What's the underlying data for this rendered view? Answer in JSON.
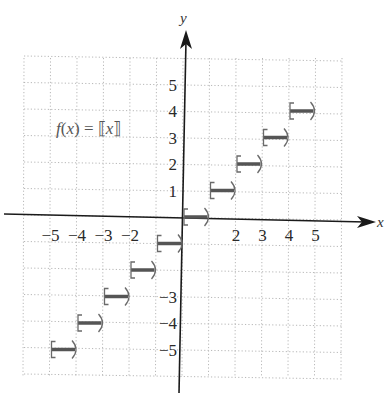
{
  "chart_data": {
    "type": "line",
    "subtype": "step",
    "title": "f(x) = ⟦x⟧",
    "function_label": {
      "prefix": "f",
      "open": "(",
      "var": "x",
      "close": ")",
      "eq": " = ",
      "bracket_open": "⟦",
      "bracket_var": "x",
      "bracket_close": "⟧"
    },
    "xlabel": "x",
    "ylabel": "y",
    "xlim": [
      -6,
      6
    ],
    "ylim": [
      -6,
      6
    ],
    "grid": true,
    "grid_style": "dotted",
    "x_ticks": [
      -5,
      -4,
      -3,
      -2,
      2,
      3,
      4,
      5
    ],
    "x_tick_labels": [
      "−5",
      "−4",
      "−3",
      "−2",
      "2",
      "3",
      "4",
      "5"
    ],
    "y_ticks": [
      5,
      4,
      3,
      2,
      1,
      -3,
      -4,
      -5
    ],
    "y_tick_labels": [
      "5",
      "4",
      "3",
      "2",
      "1",
      "−3",
      "−4",
      "−5"
    ],
    "series": [
      {
        "name": "f(x) = [[x]]",
        "segments": [
          {
            "x_start": -5,
            "x_end": -4,
            "y": -5,
            "closed_left": true,
            "open_right": true
          },
          {
            "x_start": -4,
            "x_end": -3,
            "y": -4,
            "closed_left": true,
            "open_right": true
          },
          {
            "x_start": -3,
            "x_end": -2,
            "y": -3,
            "closed_left": true,
            "open_right": true
          },
          {
            "x_start": -2,
            "x_end": -1,
            "y": -2,
            "closed_left": true,
            "open_right": true
          },
          {
            "x_start": -1,
            "x_end": 0,
            "y": -1,
            "closed_left": true,
            "open_right": true
          },
          {
            "x_start": 0,
            "x_end": 1,
            "y": 0,
            "closed_left": true,
            "open_right": true
          },
          {
            "x_start": 1,
            "x_end": 2,
            "y": 1,
            "closed_left": true,
            "open_right": true
          },
          {
            "x_start": 2,
            "x_end": 3,
            "y": 2,
            "closed_left": true,
            "open_right": true
          },
          {
            "x_start": 3,
            "x_end": 4,
            "y": 3,
            "closed_left": true,
            "open_right": true
          },
          {
            "x_start": 4,
            "x_end": 5,
            "y": 4,
            "closed_left": true,
            "open_right": true
          }
        ]
      }
    ],
    "colors": {
      "axis": "#1a1a1a",
      "grid": "#b8b8b8",
      "step": "#555555",
      "bracket": "#6a6a6a"
    }
  }
}
